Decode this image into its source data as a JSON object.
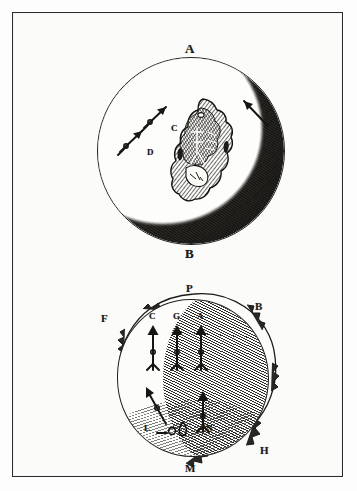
{
  "plate": {
    "title": "Lunar engravings plate",
    "border_color": "#2b2b2b",
    "paper_color": "#fbfbf9",
    "ink_color": "#1a1a1a"
  },
  "figures": [
    {
      "id": "upper-moon",
      "caption": "Crescent moon with large central crater",
      "labels": [
        {
          "id": "A",
          "text": "A",
          "role": "cusp-top",
          "size": "big"
        },
        {
          "id": "B",
          "text": "B",
          "role": "cusp-bottom",
          "size": "big"
        },
        {
          "id": "C",
          "text": "C",
          "role": "arrow-label",
          "size": "sm"
        },
        {
          "id": "D",
          "text": "D",
          "role": "arrow-label",
          "size": "sm"
        },
        {
          "id": "E",
          "text": "E",
          "role": "arrow-label",
          "size": "sm"
        }
      ],
      "arrow_count": 3
    },
    {
      "id": "lower-moon",
      "caption": "Gibbous moon with ragged terminator and rays",
      "labels": [
        {
          "id": "P",
          "text": "P",
          "role": "pole-top",
          "size": "mid"
        },
        {
          "id": "B",
          "text": "B",
          "role": "limb-upper-right",
          "size": "mid"
        },
        {
          "id": "F",
          "text": "F",
          "role": "limb-upper-left",
          "size": "mid"
        },
        {
          "id": "H",
          "text": "H",
          "role": "limb-lower-right",
          "size": "mid"
        },
        {
          "id": "M",
          "text": "M",
          "role": "pole-bottom",
          "size": "mid"
        },
        {
          "id": "C",
          "text": "C",
          "role": "arrow-label",
          "size": "sm"
        },
        {
          "id": "G",
          "text": "G",
          "role": "arrow-label",
          "size": "sm"
        },
        {
          "id": "A",
          "text": "A",
          "role": "arrow-label",
          "size": "sm"
        },
        {
          "id": "L",
          "text": "L",
          "role": "arrow-label",
          "size": "sm"
        },
        {
          "id": "N",
          "text": "N",
          "role": "arrow-label",
          "size": "sm"
        }
      ],
      "arrow_count": 5
    }
  ]
}
